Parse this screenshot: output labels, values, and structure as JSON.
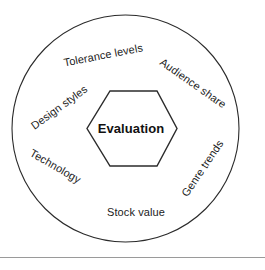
{
  "figure": {
    "title_center": "Evaluation",
    "outer_ring_labels": [
      {
        "id": "tolerance-levels",
        "text": "Tolerance levels"
      },
      {
        "id": "audience-share",
        "text": "Audience share"
      },
      {
        "id": "genre-trends",
        "text": "Genre trends"
      },
      {
        "id": "stock-value",
        "text": "Stock value"
      },
      {
        "id": "technology",
        "text": "Technology"
      },
      {
        "id": "design-styles",
        "text": "Design styles"
      }
    ],
    "shapes": {
      "outer_circle": "circle",
      "center_shape": "hexagon"
    },
    "colors": {
      "stroke": "#2b2b2b",
      "text": "#1c1c1c",
      "background": "#ffffff",
      "rule": "#9a9a9a"
    }
  }
}
